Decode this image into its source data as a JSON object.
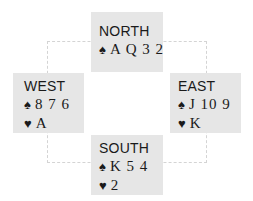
{
  "hands": {
    "north": {
      "seat": "NORTH",
      "holdings": [
        {
          "suit": "spades",
          "symbol": "♠",
          "cards": "A Q 3 2"
        }
      ]
    },
    "west": {
      "seat": "WEST",
      "holdings": [
        {
          "suit": "spades",
          "symbol": "♠",
          "cards": "8 7 6"
        },
        {
          "suit": "hearts",
          "symbol": "♥",
          "cards": "A"
        }
      ]
    },
    "east": {
      "seat": "EAST",
      "holdings": [
        {
          "suit": "spades",
          "symbol": "♠",
          "cards": "J 10 9"
        },
        {
          "suit": "hearts",
          "symbol": "♥",
          "cards": "K"
        }
      ]
    },
    "south": {
      "seat": "SOUTH",
      "holdings": [
        {
          "suit": "spades",
          "symbol": "♠",
          "cards": "K 5 4"
        },
        {
          "suit": "hearts",
          "symbol": "♥",
          "cards": "2"
        }
      ]
    }
  },
  "colors": {
    "box_background": "#e6e6e6",
    "text": "#1a1a1a",
    "dashed_line": "#d4d4d4"
  }
}
